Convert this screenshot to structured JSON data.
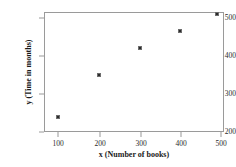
{
  "chart_data": {
    "type": "scatter",
    "title": "",
    "xlabel": "x (Number of books)",
    "ylabel": "y (Time in months)",
    "x": [
      100,
      200,
      300,
      400,
      490
    ],
    "values": [
      240,
      350,
      420,
      465,
      510
    ],
    "points": [
      {
        "x": 100,
        "y": 240
      },
      {
        "x": 200,
        "y": 350
      },
      {
        "x": 300,
        "y": 420
      },
      {
        "x": 400,
        "y": 465
      },
      {
        "x": 490,
        "y": 510
      }
    ],
    "xlim": [
      65,
      530
    ],
    "ylim": [
      190,
      525
    ],
    "xticks": [
      100,
      200,
      300,
      400,
      500
    ],
    "xtick_labels": [
      "100",
      "200",
      "300",
      "400",
      "500"
    ],
    "yticks": [
      200,
      300,
      400,
      500
    ],
    "ytick_labels": [
      "200",
      "300",
      "400",
      "500"
    ],
    "grid": false,
    "legend": null,
    "marker_color": "#2b2b2b",
    "axis_color": "#9a9a9a"
  }
}
